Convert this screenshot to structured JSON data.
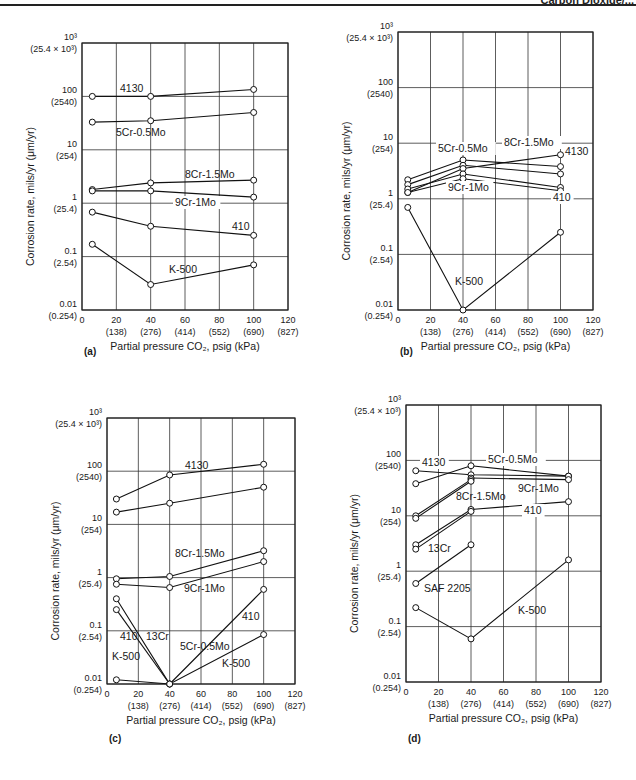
{
  "header": {
    "running_title": "Carbon Dioxide/..."
  },
  "axis_common": {
    "ylabel": "Corrosion rate, mils/yr (μm/yr)",
    "xlabel": "Partial pressure CO₂, psig (kPa)",
    "y_ticks": [
      {
        "v": 1000,
        "label": "10³",
        "sub": "(25.4 × 10³)"
      },
      {
        "v": 100,
        "label": "100",
        "sub": "(2540)"
      },
      {
        "v": 10,
        "label": "10",
        "sub": "(254)"
      },
      {
        "v": 1,
        "label": "1",
        "sub": "(25.4)"
      },
      {
        "v": 0.1,
        "label": "0.1",
        "sub": "(2.54)"
      },
      {
        "v": 0.01,
        "label": "0.01",
        "sub": "(0.254)"
      }
    ],
    "x_ticks": [
      {
        "v": 0,
        "label": "0",
        "sub": ""
      },
      {
        "v": 20,
        "label": "20",
        "sub": "(138)"
      },
      {
        "v": 40,
        "label": "40",
        "sub": "(276)"
      },
      {
        "v": 60,
        "label": "60",
        "sub": "(414)"
      },
      {
        "v": 80,
        "label": "80",
        "sub": "(552)"
      },
      {
        "v": 100,
        "label": "100",
        "sub": "(690)"
      },
      {
        "v": 120,
        "label": "120",
        "sub": "(827)"
      }
    ]
  },
  "caption": "",
  "chart_data": [
    {
      "panel": "(a)",
      "type": "line",
      "xlabel": "Partial pressure CO₂, psig (kPa)",
      "ylabel": "Corrosion rate, mils/yr (μm/yr)",
      "xlim": [
        0,
        120
      ],
      "ylim": [
        0.01,
        1000
      ],
      "yscale": "log",
      "grid": true,
      "x": [
        6,
        40,
        100
      ],
      "series": [
        {
          "name": "4130",
          "values": [
            100,
            100,
            135
          ]
        },
        {
          "name": "5Cr-0.5Mo",
          "values": [
            33,
            35,
            50
          ]
        },
        {
          "name": "8Cr-1.5Mo",
          "values": [
            1.8,
            2.4,
            2.7
          ]
        },
        {
          "name": "9Cr-1Mo",
          "values": [
            1.7,
            1.7,
            1.3
          ]
        },
        {
          "name": "410",
          "values": [
            0.68,
            0.37,
            0.25
          ]
        },
        {
          "name": "K-500",
          "values": [
            0.17,
            0.03,
            0.07
          ]
        }
      ]
    },
    {
      "panel": "(b)",
      "type": "line",
      "xlabel": "Partial pressure CO₂, psig (kPa)",
      "ylabel": "Corrosion rate, mils/yr (μm/yr)",
      "xlim": [
        0,
        120
      ],
      "ylim": [
        0.01,
        1000
      ],
      "yscale": "log",
      "grid": true,
      "x": [
        6,
        40,
        100
      ],
      "series": [
        {
          "name": "5Cr-0.5Mo",
          "values": [
            2.2,
            5.0,
            3.8
          ]
        },
        {
          "name": "8Cr-1.5Mo",
          "values": [
            1.8,
            4.0,
            2.8
          ]
        },
        {
          "name": "4130",
          "values": [
            1.3,
            3.5,
            6.2
          ]
        },
        {
          "name": "9Cr-1Mo",
          "values": [
            1.5,
            2.8,
            1.6
          ]
        },
        {
          "name": "410",
          "values": [
            1.3,
            2.3,
            1.4
          ]
        },
        {
          "name": "K-500",
          "values": [
            0.7,
            0.01,
            0.25
          ]
        }
      ]
    },
    {
      "panel": "(c)",
      "type": "line",
      "xlabel": "Partial pressure CO₂, psig (kPa)",
      "ylabel": "Corrosion rate, mils/yr (μm/yr)",
      "xlim": [
        0,
        120
      ],
      "ylim": [
        0.01,
        1000
      ],
      "yscale": "log",
      "grid": true,
      "x": [
        6,
        40,
        100
      ],
      "series": [
        {
          "name": "4130",
          "values": [
            30,
            85,
            135
          ]
        },
        {
          "name": "5Cr-0.5Mo",
          "values": [
            17,
            25,
            50
          ]
        },
        {
          "name": "8Cr-1.5Mo",
          "values": [
            0.95,
            1.05,
            3.2
          ]
        },
        {
          "name": "9Cr-1Mo",
          "values": [
            0.75,
            0.65,
            2.0
          ]
        },
        {
          "name": "410",
          "values": [
            0.4,
            0.01,
            0.6
          ]
        },
        {
          "name": "13Cr",
          "values": [
            0.25,
            0.01,
            null
          ]
        },
        {
          "name": "K-500",
          "values": [
            0.012,
            0.01,
            0.085
          ]
        }
      ]
    },
    {
      "panel": "(d)",
      "type": "line",
      "xlabel": "Partial pressure CO₂, psig (kPa)",
      "ylabel": "Corrosion rate, mils/yr (μm/yr)",
      "xlim": [
        0,
        120
      ],
      "ylim": [
        0.01,
        1000
      ],
      "yscale": "log",
      "grid": true,
      "x": [
        6,
        40,
        100
      ],
      "series": [
        {
          "name": "4130",
          "values": [
            65,
            55,
            52
          ]
        },
        {
          "name": "5Cr-0.5Mo",
          "values": [
            38,
            80,
            52
          ]
        },
        {
          "name": "9Cr-1Mo",
          "values": [
            null,
            48,
            45
          ]
        },
        {
          "name": "8Cr-1.5Mo",
          "values": [
            10,
            45,
            null
          ]
        },
        {
          "name": "8Cr-1.5Mo (b)",
          "values": [
            9,
            42,
            null
          ]
        },
        {
          "name": "410",
          "values": [
            3.0,
            13,
            18
          ]
        },
        {
          "name": "13Cr",
          "values": [
            2.5,
            12,
            null
          ]
        },
        {
          "name": "SAF 2205",
          "values": [
            0.6,
            3.0,
            null
          ]
        },
        {
          "name": "K-500",
          "values": [
            0.22,
            0.06,
            1.6
          ]
        }
      ]
    }
  ],
  "panels": [
    {
      "id": "a",
      "label": "(a)",
      "left": 82,
      "right": 288,
      "top": 43,
      "bottom": 310,
      "caption_y": 355,
      "labels": [
        {
          "text": "4130",
          "x": 120,
          "y": 92
        },
        {
          "text": "5Cr-0.5Mo",
          "x": 116,
          "y": 136
        },
        {
          "text": "8Cr-1.5Mo",
          "x": 185,
          "y": 178
        },
        {
          "text": "9Cr-1Mo",
          "x": 175,
          "y": 206,
          "bg": true
        },
        {
          "text": "410",
          "x": 232,
          "y": 230
        },
        {
          "text": "K-500",
          "x": 169,
          "y": 273
        }
      ]
    },
    {
      "id": "b",
      "label": "(b)",
      "left": 398,
      "right": 593,
      "top": 32,
      "bottom": 310,
      "caption_y": 355,
      "labels": [
        {
          "text": "5Cr-0.5Mo",
          "x": 438,
          "y": 152,
          "bg": true
        },
        {
          "text": "8Cr-1.5Mo",
          "x": 504,
          "y": 146,
          "bg": true
        },
        {
          "text": "4130",
          "x": 565,
          "y": 155
        },
        {
          "text": "9Cr-1Mo",
          "x": 448,
          "y": 191,
          "bg": true
        },
        {
          "text": "410",
          "x": 553,
          "y": 201,
          "bg": true
        },
        {
          "text": "K-500",
          "x": 455,
          "y": 285
        }
      ]
    },
    {
      "id": "c",
      "label": "(c)",
      "left": 107,
      "right": 295,
      "top": 418,
      "bottom": 684,
      "caption_y": 742,
      "labels": [
        {
          "text": "4130",
          "x": 185,
          "y": 469
        },
        {
          "text": "5Cr-0.5Mo",
          "x": 180,
          "y": 650,
          "bg": false,
          "rel": "5cr"
        },
        {
          "text": "8Cr-1.5Mo",
          "x": 175,
          "y": 557
        },
        {
          "text": "9Cr-1Mo",
          "x": 184,
          "y": 592
        },
        {
          "text": "410",
          "x": 242,
          "y": 620
        },
        {
          "text": "410",
          "x": 120,
          "y": 640
        },
        {
          "text": "13Cr",
          "x": 146,
          "y": 640
        },
        {
          "text": "K-500",
          "x": 112,
          "y": 660
        },
        {
          "text": "K-500",
          "x": 222,
          "y": 667
        }
      ]
    },
    {
      "id": "d",
      "label": "(d)",
      "left": 406,
      "right": 601,
      "top": 405,
      "bottom": 682,
      "caption_y": 742,
      "labels": [
        {
          "text": "4130",
          "x": 422,
          "y": 466,
          "bg": true
        },
        {
          "text": "5Cr-0.5Mo",
          "x": 488,
          "y": 463,
          "bg": true
        },
        {
          "text": "9Cr-1Mo",
          "x": 518,
          "y": 492
        },
        {
          "text": "8Cr-1.5Mo",
          "x": 456,
          "y": 500
        },
        {
          "text": "410",
          "x": 524,
          "y": 514,
          "bg": true
        },
        {
          "text": "13Cr",
          "x": 428,
          "y": 552
        },
        {
          "text": "SAF 2205",
          "x": 424,
          "y": 592
        },
        {
          "text": "K-500",
          "x": 518,
          "y": 614
        }
      ]
    }
  ]
}
